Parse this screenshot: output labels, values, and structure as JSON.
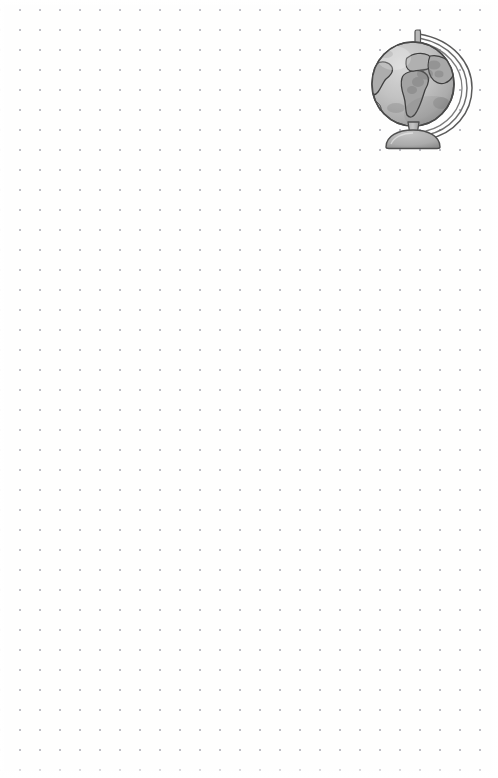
{
  "page": {
    "type": "dot-grid-notebook-page",
    "background_color": "#fefefe",
    "width": 498,
    "height": 778,
    "text_content": "",
    "is_blank": true
  },
  "dot_grid": {
    "spacing_px": 20,
    "dot_color": "#b9b9c2",
    "dot_radius_px": 1,
    "origin_x_px": 10,
    "origin_y_px": 20,
    "columns": 25,
    "rows": 38
  },
  "illustration": {
    "name": "globe",
    "label": "Desk globe on stand",
    "position": "top-right",
    "style": "grayscale watercolor sketch",
    "left_px": 362,
    "top_px": 18,
    "width_px": 118,
    "height_px": 132,
    "colors": {
      "sphere_light": "#c9c9c9",
      "sphere_mid": "#b2b2b2",
      "sphere_shadow": "#9a9a9a",
      "continent_fill": "#a6a6a6",
      "outline": "#4a4a4a",
      "meridian_ring": "#8f8f8f",
      "stand": "#b0b0b0",
      "stand_shadow": "#919191"
    },
    "parts": [
      {
        "name": "sphere",
        "label": "Globe sphere"
      },
      {
        "name": "meridian-ring",
        "label": "Meridian ring"
      },
      {
        "name": "axis-post",
        "label": "Top axis post"
      },
      {
        "name": "neck",
        "label": "Support neck"
      },
      {
        "name": "base",
        "label": "Globe base"
      },
      {
        "name": "continent-africa",
        "label": "Africa"
      },
      {
        "name": "continent-south-america",
        "label": "South America"
      },
      {
        "name": "continent-europe",
        "label": "Europe"
      },
      {
        "name": "continent-asia",
        "label": "Asia"
      }
    ]
  }
}
